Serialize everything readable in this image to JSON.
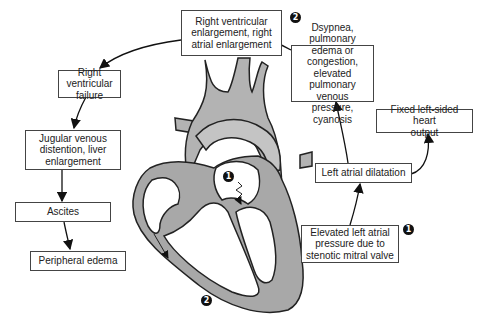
{
  "diagram": {
    "type": "flowchart-with-anatomy",
    "boxes": {
      "rv_enlargement": "Right ventricular\nenlargement, right\natrial enlargement",
      "dyspnea": "Dsypnea, pulmonary\nedema or congestion,\nelevated pulmonary\nvenous pressure,\ncyanosis",
      "fixed_output": "Fixed left-sided heart\noutput",
      "la_dilatation": "Left atrial dilatation",
      "elevated_la": "Elevated left atrial\npressure due to\nstenotic mitral valve",
      "rv_failure": "Right ventricular\nfailure",
      "jugular": "Jugular venous\ndistention, liver\nenlargement",
      "ascites": "Ascites",
      "peripheral": "Peripheral edema"
    },
    "badges": {
      "one": "1",
      "two": "2"
    },
    "flow": [
      "Elevated left atrial pressure due to stenotic mitral valve",
      "Left atrial dilatation",
      "Dsypnea, pulmonary edema or congestion, elevated pulmonary venous pressure, cyanosis",
      "Right ventricular enlargement, right atrial enlargement",
      "Right ventricular failure",
      "Jugular venous distention, liver enlargement",
      "Ascites",
      "Peripheral edema"
    ],
    "branch": {
      "from": "Left atrial dilatation",
      "to": "Fixed left-sided heart output"
    },
    "colors": {
      "heart_fill": "#b3b3b3",
      "outline": "#222222",
      "box_border": "#444444"
    }
  }
}
